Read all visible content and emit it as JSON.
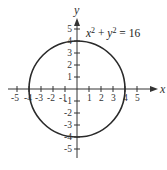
{
  "diagram": {
    "type": "circle-graph",
    "equation": {
      "lhs_x": "x",
      "lhs_y": "y",
      "exp": "2",
      "plus": " + ",
      "rhs": " = 16"
    },
    "axes": {
      "x_label": "x",
      "y_label": "y",
      "x_ticks": [
        "-5",
        "-4",
        "-3",
        "-2",
        "-1",
        "1",
        "2",
        "3",
        "4",
        "5"
      ],
      "y_ticks": [
        "5",
        "4",
        "3",
        "2",
        "1",
        "-1",
        "-2",
        "-3",
        "-4",
        "-5"
      ]
    },
    "circle": {
      "center": [
        0,
        0
      ],
      "radius": 4
    },
    "colors": {
      "curve": "#2a2a2a",
      "axes": "#333333"
    }
  }
}
